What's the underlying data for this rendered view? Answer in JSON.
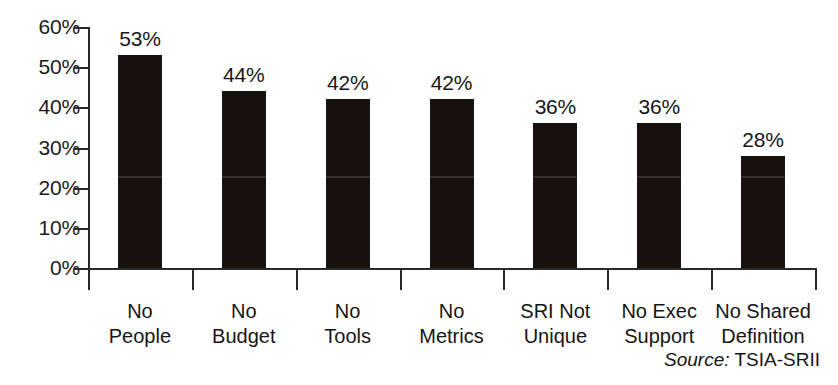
{
  "chart_data": {
    "type": "bar",
    "title": "",
    "subtitle": "",
    "xlabel": "",
    "ylabel": "",
    "ylim": [
      0,
      60
    ],
    "ytick_values": [
      60,
      50,
      40,
      30,
      20,
      10,
      0
    ],
    "ytick_labels": [
      "60%",
      "50%",
      "40%",
      "30%",
      "20%",
      "10%",
      "0%"
    ],
    "grid": false,
    "legend": "none",
    "bar_color": "#171210",
    "axis_color": "#2a2a2a",
    "text_color": "#161616",
    "categories": [
      "No People",
      "No Budget",
      "No Tools",
      "No Metrics",
      "SRI Not Unique",
      "No Exec Support",
      "No Shared Definition"
    ],
    "category_lines": [
      [
        "No",
        "People"
      ],
      [
        "No",
        "Budget"
      ],
      [
        "No",
        "Tools"
      ],
      [
        "No",
        "Metrics"
      ],
      [
        "SRI Not",
        "Unique"
      ],
      [
        "No Exec",
        "Support"
      ],
      [
        "No Shared",
        "Definition"
      ]
    ],
    "values": [
      53,
      44,
      42,
      42,
      36,
      36,
      28
    ],
    "data_labels": [
      "53%",
      "44%",
      "42%",
      "42%",
      "36%",
      "36%",
      "28%"
    ],
    "annotations": {
      "source_prefix": "Source:",
      "source_value": " TSIA-SRII"
    }
  }
}
